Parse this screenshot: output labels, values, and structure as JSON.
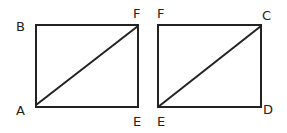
{
  "diagram": {
    "stroke_color": "#222222",
    "background": "#ffffff",
    "figures": [
      {
        "name": "rectangle-ABEF",
        "corners": {
          "top_left": "B",
          "top_right": "F",
          "bottom_left": "A",
          "bottom_right": "E"
        },
        "diagonal": [
          "A",
          "F"
        ]
      },
      {
        "name": "rectangle-FCDE",
        "corners": {
          "top_left": "F",
          "top_right": "C",
          "bottom_left": "E",
          "bottom_right": "D"
        },
        "diagonal": [
          "E",
          "C"
        ]
      }
    ],
    "labels": {
      "r1_B": "B",
      "r1_F": "F",
      "r1_A": "A",
      "r1_E": "E",
      "r2_F": "F",
      "r2_C": "C",
      "r2_E": "E",
      "r2_D": "D"
    }
  }
}
